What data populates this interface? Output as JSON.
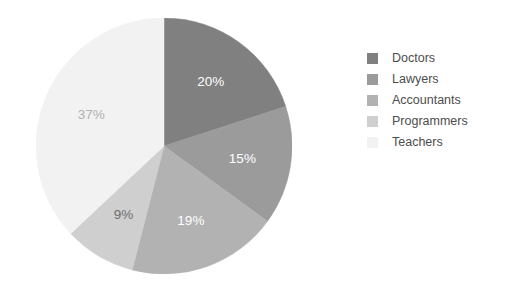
{
  "chart_data": {
    "type": "pie",
    "title": "",
    "subtitle": "",
    "categories": [
      "Doctors",
      "Lawyers",
      "Accountants",
      "Programmers",
      "Teachers"
    ],
    "values": [
      20,
      15,
      19,
      9,
      37
    ],
    "value_labels": [
      "20%",
      "15%",
      "19%",
      "9%",
      "37%"
    ],
    "unit": "%",
    "total": 100,
    "start_angle_deg": 0,
    "direction": "clockwise",
    "colors": [
      "#808080",
      "#9b9b9b",
      "#b2b2b2",
      "#cfcfcf",
      "#f2f2f2"
    ],
    "label_colors": [
      "#ffffff",
      "#ffffff",
      "#ffffff",
      "#6e6e6e",
      "#b0b0b0"
    ],
    "legend": {
      "position": "right",
      "entries": [
        {
          "label": "Doctors",
          "color": "#808080",
          "value": 20
        },
        {
          "label": "Lawyers",
          "color": "#9b9b9b",
          "value": 15
        },
        {
          "label": "Accountants",
          "color": "#b2b2b2",
          "value": 19
        },
        {
          "label": "Programmers",
          "color": "#cfcfcf",
          "value": 9
        },
        {
          "label": "Teachers",
          "color": "#f2f2f2",
          "value": 37
        }
      ]
    },
    "grid": false,
    "xlabel": "",
    "ylabel": ""
  },
  "figure": {
    "background": "#ffffff",
    "center_x": 128,
    "center_y": 128,
    "radius": 128
  }
}
